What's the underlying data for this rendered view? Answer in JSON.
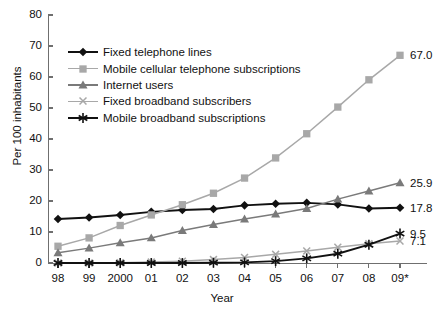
{
  "chart_data": {
    "type": "line",
    "title": "",
    "xlabel": "Year",
    "ylabel": "Per 100 inhabitants",
    "x": [
      "98",
      "99",
      "2000",
      "01",
      "02",
      "03",
      "04",
      "05",
      "06",
      "07",
      "08",
      "09*"
    ],
    "x_values": [
      1998,
      1999,
      2000,
      2001,
      2002,
      2003,
      2004,
      2005,
      2006,
      2007,
      2008,
      2009
    ],
    "ylim": [
      0,
      80
    ],
    "yticks": [
      0,
      10,
      20,
      30,
      40,
      50,
      60,
      70,
      80
    ],
    "grid": false,
    "legend_position": "upper-left-inside",
    "note": "09* denotes estimate",
    "series": [
      {
        "name": "Fixed telephone lines",
        "marker": "diamond",
        "color": "#111111",
        "values": [
          14.2,
          14.7,
          15.5,
          16.5,
          17.1,
          17.4,
          18.6,
          19.1,
          19.4,
          18.9,
          17.6,
          17.8
        ],
        "end_label": "17.8"
      },
      {
        "name": "Mobile cellular telephone subscriptions",
        "marker": "square",
        "color": "#a8a8a8",
        "values": [
          5.4,
          8.1,
          12.1,
          15.5,
          18.8,
          22.5,
          27.4,
          33.9,
          41.7,
          50.3,
          59.1,
          67.0
        ],
        "end_label": "67.0"
      },
      {
        "name": "Internet users",
        "marker": "triangle",
        "color": "#7a7a7a",
        "values": [
          3.3,
          4.8,
          6.5,
          8.1,
          10.5,
          12.4,
          14.2,
          15.8,
          17.6,
          20.6,
          23.2,
          25.9
        ],
        "end_label": "25.9"
      },
      {
        "name": "Fixed broadband subscribers",
        "marker": "x",
        "color": "#a8a8a8",
        "values": [
          0.0,
          0.0,
          0.1,
          0.3,
          0.6,
          1.1,
          1.8,
          2.8,
          3.9,
          5.1,
          6.2,
          7.1
        ],
        "end_label": "7.1"
      },
      {
        "name": "Mobile broadband subscriptions",
        "marker": "asterisk",
        "color": "#111111",
        "values": [
          0.0,
          0.0,
          0.0,
          0.0,
          0.0,
          0.1,
          0.2,
          0.6,
          1.5,
          3.0,
          5.9,
          9.5
        ],
        "end_label": "9.5"
      }
    ]
  }
}
